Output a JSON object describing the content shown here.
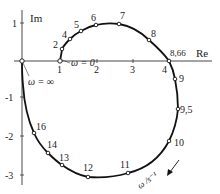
{
  "diagram": {
    "type": "nyquist-plot",
    "axes": {
      "x_label": "Re",
      "y_label": "Im",
      "x_ticks": [
        "1",
        "2",
        "3",
        "4"
      ],
      "y_ticks": [
        "1",
        "-1",
        "-2",
        "-3"
      ]
    },
    "annotations": {
      "omega_zero": "ω = 0",
      "omega_inf": "ω = ∞",
      "omega_unit": "ω /s⁻¹"
    },
    "points": [
      {
        "label": "2"
      },
      {
        "label": "4"
      },
      {
        "label": "5"
      },
      {
        "label": "6"
      },
      {
        "label": "7"
      },
      {
        "label": "8"
      },
      {
        "label": "8,66"
      },
      {
        "label": "9"
      },
      {
        "label": "9,5"
      },
      {
        "label": "10"
      },
      {
        "label": "11"
      },
      {
        "label": "12"
      },
      {
        "label": "13"
      },
      {
        "label": "14"
      },
      {
        "label": "16"
      }
    ],
    "colors": {
      "curve": "#111111",
      "axis": "#333333",
      "marker_fill": "#ffffff"
    }
  }
}
